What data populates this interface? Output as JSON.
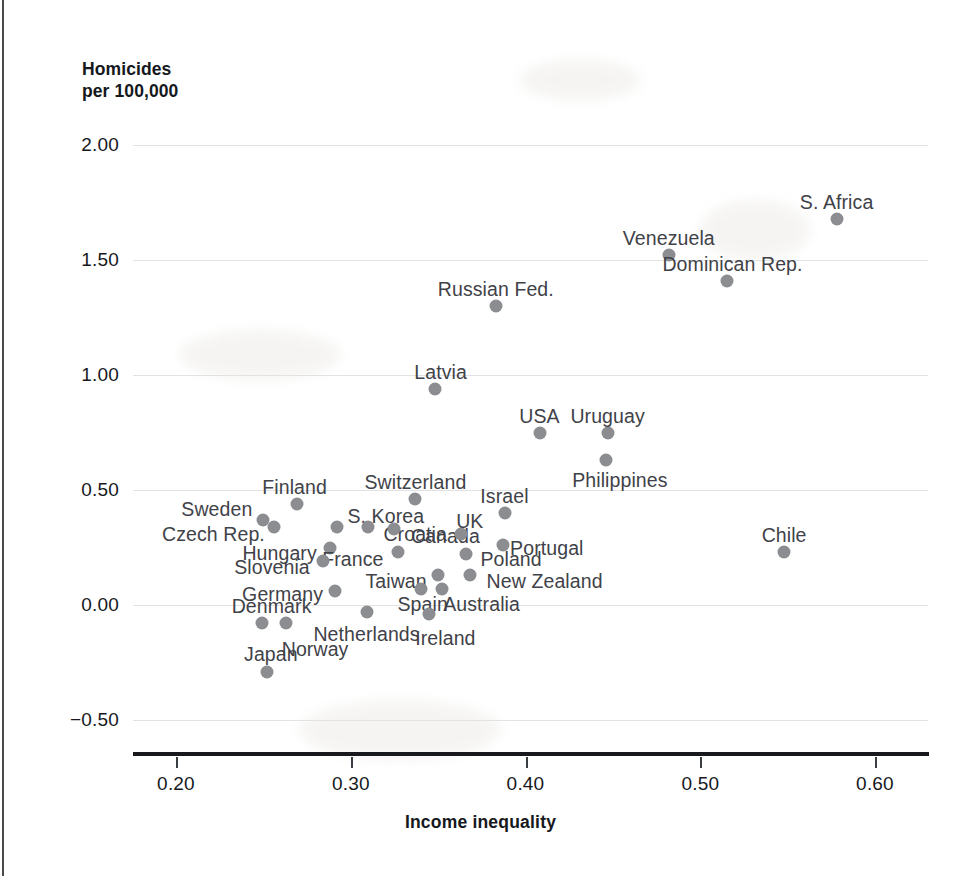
{
  "chart_data": {
    "type": "scatter",
    "title": "",
    "ylabel": "Homicides\nper 100,000",
    "xlabel": "Income inequality",
    "xlim": [
      0.175,
      0.63
    ],
    "ylim": [
      -0.62,
      2.12
    ],
    "xticks": [
      "0.20",
      "0.30",
      "0.40",
      "0.50",
      "0.60"
    ],
    "xtick_values": [
      0.2,
      0.3,
      0.4,
      0.5,
      0.6
    ],
    "yticks": [
      "2.00",
      "1.50",
      "1.00",
      "0.50",
      "0.00",
      "−0.50"
    ],
    "ytick_values": [
      2.0,
      1.5,
      1.0,
      0.5,
      0.0,
      -0.5
    ],
    "grid": "horizontal",
    "legend": "none",
    "marker_color": "#8b8d90",
    "label_color": "#3f4248",
    "axis_color": "#17191d",
    "grid_color": "#e2e2e4",
    "points": [
      {
        "label": "S. Africa",
        "x": 0.578,
        "y": 1.68,
        "label_anchor": "center",
        "label_dx": 0,
        "label_dy": -17
      },
      {
        "label": "Venezuela",
        "x": 0.482,
        "y": 1.52,
        "label_anchor": "center",
        "label_dx": 0,
        "label_dy": -17
      },
      {
        "label": "Dominican Rep.",
        "x": 0.515,
        "y": 1.41,
        "label_anchor": "center",
        "label_dx": 6,
        "label_dy": -17
      },
      {
        "label": "Russian Fed.",
        "x": 0.383,
        "y": 1.3,
        "label_anchor": "center",
        "label_dx": 0,
        "label_dy": -17
      },
      {
        "label": "Latvia",
        "x": 0.348,
        "y": 0.94,
        "label_anchor": "center",
        "label_dx": 6,
        "label_dy": -17
      },
      {
        "label": "USA",
        "x": 0.408,
        "y": 0.75,
        "label_anchor": "center",
        "label_dx": 0,
        "label_dy": -17
      },
      {
        "label": "Uruguay",
        "x": 0.447,
        "y": 0.75,
        "label_anchor": "center",
        "label_dx": 0,
        "label_dy": -17
      },
      {
        "label": "Philippines",
        "x": 0.446,
        "y": 0.63,
        "label_anchor": "center",
        "label_dx": 14,
        "label_dy": 20
      },
      {
        "label": "Finland",
        "x": 0.269,
        "y": 0.44,
        "label_anchor": "center",
        "label_dx": -2,
        "label_dy": -17
      },
      {
        "label": "Switzerland",
        "x": 0.337,
        "y": 0.46,
        "label_anchor": "center",
        "label_dx": 0,
        "label_dy": -17
      },
      {
        "label": "Israel",
        "x": 0.388,
        "y": 0.4,
        "label_anchor": "center",
        "label_dx": 0,
        "label_dy": -17
      },
      {
        "label": "Sweden",
        "x": 0.25,
        "y": 0.37,
        "label_anchor": "end",
        "label_dx": -11,
        "label_dy": -11
      },
      {
        "label": "Czech Rep.",
        "x": 0.256,
        "y": 0.34,
        "label_anchor": "end",
        "label_dx": -9,
        "label_dy": 7
      },
      {
        "label": "S. Korea",
        "x": 0.292,
        "y": 0.34,
        "label_anchor": "center",
        "label_dx": 49,
        "label_dy": -11
      },
      {
        "label": "Croatia",
        "x": 0.31,
        "y": 0.34,
        "label_anchor": "center",
        "label_dx": 47,
        "label_dy": 7
      },
      {
        "label": "Canada",
        "x": 0.325,
        "y": 0.33,
        "label_anchor": "center",
        "label_dx": 51,
        "label_dy": 7
      },
      {
        "label": "UK",
        "x": 0.363,
        "y": 0.31,
        "label_anchor": "center",
        "label_dx": 9,
        "label_dy": -13
      },
      {
        "label": "Portugal",
        "x": 0.387,
        "y": 0.26,
        "label_anchor": "center",
        "label_dx": 44,
        "label_dy": 3
      },
      {
        "label": "Chile",
        "x": 0.548,
        "y": 0.23,
        "label_anchor": "center",
        "label_dx": 0,
        "label_dy": -17
      },
      {
        "label": "Hungary",
        "x": 0.288,
        "y": 0.25,
        "label_anchor": "end",
        "label_dx": -13,
        "label_dy": 5
      },
      {
        "label": "France",
        "x": 0.327,
        "y": 0.23,
        "label_anchor": "center",
        "label_dx": -45,
        "label_dy": 7
      },
      {
        "label": "Poland",
        "x": 0.366,
        "y": 0.22,
        "label_anchor": "center",
        "label_dx": 45,
        "label_dy": 5
      },
      {
        "label": "Slovenia",
        "x": 0.284,
        "y": 0.19,
        "label_anchor": "end",
        "label_dx": -13,
        "label_dy": 6
      },
      {
        "label": "Taiwan",
        "x": 0.35,
        "y": 0.13,
        "label_anchor": "center",
        "label_dx": -42,
        "label_dy": 6
      },
      {
        "label": "New Zealand",
        "x": 0.368,
        "y": 0.13,
        "label_anchor": "center",
        "label_dx": 75,
        "label_dy": 6
      },
      {
        "label": "Germany",
        "x": 0.291,
        "y": 0.06,
        "label_anchor": "end",
        "label_dx": -12,
        "label_dy": 3
      },
      {
        "label": "Spain",
        "x": 0.34,
        "y": 0.07,
        "label_anchor": "center",
        "label_dx": 2,
        "label_dy": 15
      },
      {
        "label": "Australia",
        "x": 0.352,
        "y": 0.07,
        "label_anchor": "center",
        "label_dx": 40,
        "label_dy": 15
      },
      {
        "label": "Netherlands",
        "x": 0.309,
        "y": -0.03,
        "label_anchor": "center",
        "label_dx": 0,
        "label_dy": 22
      },
      {
        "label": "Denmark",
        "x": 0.249,
        "y": -0.08,
        "label_anchor": "center",
        "label_dx": 10,
        "label_dy": -17
      },
      {
        "label": "Norway",
        "x": 0.263,
        "y": -0.08,
        "label_anchor": "center",
        "label_dx": 29,
        "label_dy": 26
      },
      {
        "label": "Ireland",
        "x": 0.345,
        "y": -0.04,
        "label_anchor": "center",
        "label_dx": 16,
        "label_dy": 24
      },
      {
        "label": "Japan",
        "x": 0.252,
        "y": -0.29,
        "label_anchor": "center",
        "label_dx": 4,
        "label_dy": -18
      }
    ]
  }
}
